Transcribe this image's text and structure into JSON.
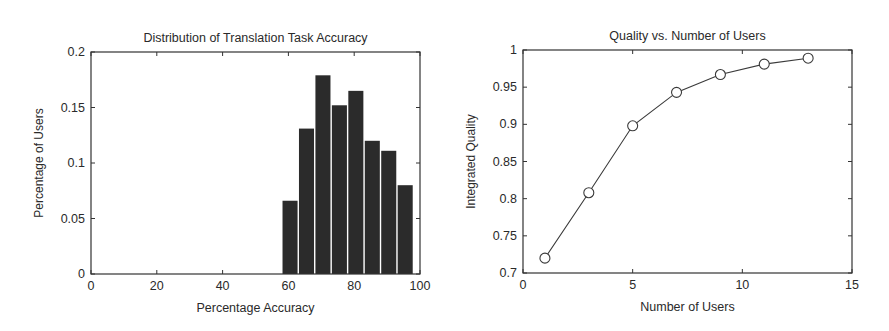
{
  "chart_data": [
    {
      "type": "bar",
      "title": "Distribution of Translation Task Accuracy",
      "xlabel": "Percentage Accuracy",
      "ylabel": "Percentage of Users",
      "xlim": [
        0,
        100
      ],
      "ylim": [
        0,
        0.2
      ],
      "xticks": [
        0,
        20,
        40,
        60,
        80,
        100
      ],
      "xtick_labels": [
        "0",
        "20",
        "40",
        "60",
        "80",
        "100"
      ],
      "yticks": [
        0,
        0.05,
        0.1,
        0.15,
        0.2
      ],
      "ytick_labels": [
        "0",
        "0.05",
        "0.1",
        "0.15",
        "0.2"
      ],
      "grid": false,
      "bar_color": "#2b2b2b",
      "bin_width": 5,
      "categories": [
        60.5,
        65.5,
        70.5,
        75.5,
        80.5,
        85.5,
        90.5,
        95.5
      ],
      "values": [
        0.066,
        0.131,
        0.179,
        0.152,
        0.165,
        0.12,
        0.111,
        0.08
      ]
    },
    {
      "type": "line",
      "title": "Quality vs. Number of Users",
      "xlabel": "Number of Users",
      "ylabel": "Integrated Quality",
      "xlim": [
        0,
        15
      ],
      "ylim": [
        0.7,
        1
      ],
      "xticks": [
        0,
        5,
        10,
        15
      ],
      "xtick_labels": [
        "0",
        "5",
        "10",
        "15"
      ],
      "yticks": [
        0.7,
        0.75,
        0.8,
        0.85,
        0.9,
        0.95,
        1
      ],
      "ytick_labels": [
        "0.7",
        "0.75",
        "0.8",
        "0.85",
        "0.9",
        "0.95",
        "1"
      ],
      "grid": false,
      "marker": "circle-open",
      "line_color": "#3a3a3a",
      "series": [
        {
          "name": "Integrated Quality",
          "x": [
            1,
            3,
            5,
            7,
            9,
            11,
            13
          ],
          "values": [
            0.72,
            0.808,
            0.898,
            0.943,
            0.967,
            0.981,
            0.989
          ]
        }
      ]
    }
  ]
}
